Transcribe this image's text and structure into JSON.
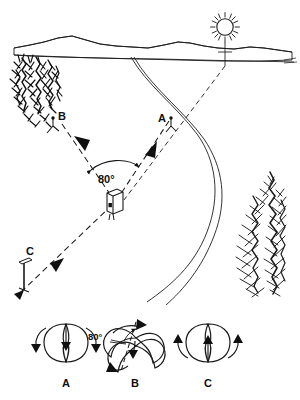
{
  "figure": {
    "background_color": "#ffffff",
    "ink_color": "#1a1a1a",
    "terrain_fill": "#d9d9d9"
  },
  "scene": {
    "name": "landscape-perspective-view",
    "station_labels": {
      "a": "A",
      "b": "B",
      "c": "C"
    },
    "angle_label": "80°",
    "elements": {
      "sun": "sun-icon",
      "horizon": "mountain-horizon-band",
      "left_trees": "conifer-cluster",
      "right_tree": "conifer-tree",
      "road": "winding-road",
      "instrument": "survey-instrument-box"
    }
  },
  "panels": {
    "items": [
      {
        "id": "panel-a",
        "label": "A",
        "angle_label": "",
        "has_axis": false,
        "arrow_direction": "down"
      },
      {
        "id": "panel-b",
        "label": "B",
        "angle_label": "80°",
        "has_axis": true,
        "arrow_direction": "rotated"
      },
      {
        "id": "panel-c",
        "label": "C",
        "angle_label": "",
        "has_axis": false,
        "arrow_direction": "up"
      }
    ]
  }
}
